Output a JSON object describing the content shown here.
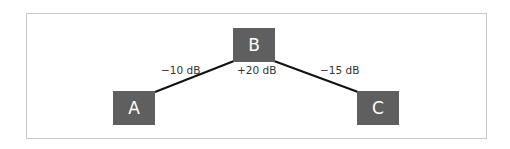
{
  "nodes": [
    {
      "id": "A",
      "label": "A"
    },
    {
      "id": "B",
      "label": "B"
    },
    {
      "id": "C",
      "label": "C"
    }
  ],
  "edges": [
    {
      "from": "A",
      "to": "B",
      "label": "−10 dB"
    },
    {
      "from": "B",
      "to": "C",
      "label": "−15 dB"
    }
  ],
  "node_annotations": {
    "B": "+20 dB"
  },
  "colors": {
    "node_fill": "#5f5f5f",
    "node_text": "#ffffff",
    "edge": "#111111",
    "frame_border": "#c8c8c8"
  }
}
